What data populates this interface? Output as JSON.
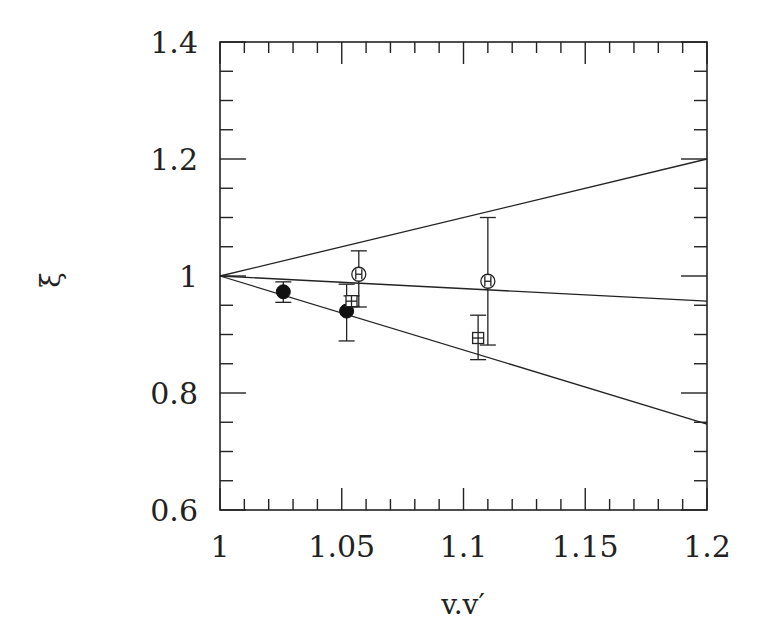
{
  "chart_data": {
    "type": "scatter",
    "title": "",
    "xlabel": "v.v′",
    "ylabel": "ξ",
    "xlim": [
      1.0,
      1.2
    ],
    "ylim": [
      0.6,
      1.4
    ],
    "x_ticks": [
      1,
      1.05,
      1.1,
      1.15,
      1.2
    ],
    "x_tick_labels": [
      "1",
      "1.05",
      "1.1",
      "1.15",
      "1.2"
    ],
    "x_minor_step": 0.01,
    "y_ticks": [
      0.6,
      0.8,
      1.0,
      1.2,
      1.4
    ],
    "y_tick_labels": [
      "0.6",
      "0.8",
      "1",
      "1.2",
      "1.4"
    ],
    "y_minor_step": 0.05,
    "grid": false,
    "legend": null,
    "lines": [
      {
        "name": "upper-bound",
        "x": [
          1.0,
          1.2
        ],
        "y": [
          1.0,
          1.2
        ]
      },
      {
        "name": "middle",
        "x": [
          1.0,
          1.2
        ],
        "y": [
          1.0,
          0.957
        ]
      },
      {
        "name": "lower-bound",
        "x": [
          1.0,
          1.2
        ],
        "y": [
          1.0,
          0.747
        ]
      }
    ],
    "series": [
      {
        "name": "filled-circles",
        "marker": "filled-circle",
        "points": [
          {
            "x": 1.026,
            "y": 0.973,
            "y_hi": 0.99,
            "y_lo": 0.955
          },
          {
            "x": 1.052,
            "y": 0.94,
            "y_hi": 0.986,
            "y_lo": 0.889
          }
        ]
      },
      {
        "name": "open-circles",
        "marker": "open-circle-cross",
        "points": [
          {
            "x": 1.057,
            "y": 1.003,
            "y_hi": 1.043,
            "y_lo": 0.947
          },
          {
            "x": 1.11,
            "y": 0.991,
            "y_hi": 1.1,
            "y_lo": 0.882
          }
        ]
      },
      {
        "name": "open-squares",
        "marker": "open-square-cross",
        "points": [
          {
            "x": 1.054,
            "y": 0.957,
            "y_hi": 0.966,
            "y_lo": 0.948
          },
          {
            "x": 1.106,
            "y": 0.894,
            "y_hi": 0.933,
            "y_lo": 0.857
          }
        ]
      }
    ]
  },
  "layout": {
    "plot_left": 220,
    "plot_right": 707,
    "plot_top": 42,
    "plot_bottom": 510
  }
}
